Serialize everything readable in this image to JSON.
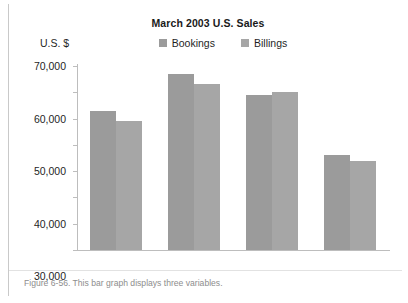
{
  "figure": {
    "caption": "Figure 6-56. This bar graph displays three variables."
  },
  "chart_data": {
    "type": "bar",
    "title": "March 2003 U.S. Sales",
    "xlabel": "",
    "ylabel": "U.S. $",
    "categories": [
      "North",
      "East",
      "South",
      "West"
    ],
    "series": [
      {
        "name": "Bookings",
        "color": "#9b9b9b",
        "values": [
          53000,
          67000,
          59000,
          36000
        ]
      },
      {
        "name": "Billings",
        "color": "#a6a6a6",
        "values": [
          49000,
          63000,
          60000,
          34000
        ]
      }
    ],
    "ylim": [
      0,
      70000
    ],
    "ytick_labels": [
      "70,000",
      "60,000",
      "50,000",
      "40,000",
      "30,000",
      "20,000",
      "10,000",
      "0"
    ],
    "ytick_values": [
      70000,
      60000,
      50000,
      40000,
      30000,
      20000,
      10000,
      0
    ],
    "grid": false,
    "legend_position": "top-center"
  }
}
